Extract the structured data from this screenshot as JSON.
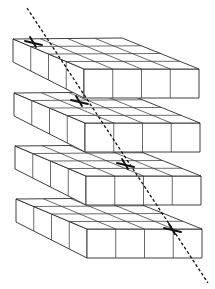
{
  "figure": {
    "description": "Four stacked slabs, each a 4x4 grid of cubes, with a dashed ray passing diagonally through all slabs, marked with an X on each slab's top face",
    "slab_count": 4,
    "grid": {
      "columns": 4,
      "rows": 4
    },
    "colors": {
      "line": "#2a2a2a",
      "background": "#ffffff",
      "ray": "#111111"
    },
    "slabs": [
      {
        "id": 1,
        "origin": [
          13,
          39
        ],
        "mark": [
          33,
          42
        ]
      },
      {
        "id": 2,
        "origin": [
          14,
          93
        ],
        "mark": [
          79,
          101
        ]
      },
      {
        "id": 3,
        "origin": [
          15,
          146
        ],
        "mark": [
          125,
          164
        ]
      },
      {
        "id": 4,
        "origin": [
          16,
          199
        ],
        "mark": [
          172,
          229
        ]
      }
    ],
    "ray": {
      "start": [
        27,
        8
      ],
      "end": [
        208,
        283
      ]
    }
  }
}
